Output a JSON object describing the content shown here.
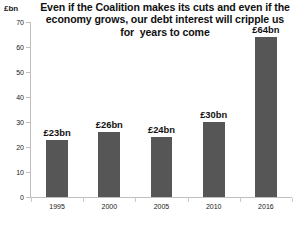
{
  "chart_data": {
    "type": "bar",
    "title": "Even if the Coalition makes its cuts and even if the\neconomy grows, our debt interest will cripple us\nfor  years to come",
    "title_lines": [
      "Even if the Coalition makes its cuts and even if the",
      "economy grows, our debt interest will cripple us",
      "for  years to come"
    ],
    "xlabel": "",
    "ylabel": "£bn",
    "ylim": [
      0,
      70
    ],
    "ytick_values": [
      0,
      10,
      20,
      30,
      40,
      50,
      60,
      70
    ],
    "ytick_labels": [
      "0",
      "10",
      "20",
      "30",
      "40",
      "50",
      "60",
      "70"
    ],
    "categories": [
      "1995",
      "2000",
      "2005",
      "2010",
      "2016"
    ],
    "values": [
      23,
      26,
      24,
      30,
      64
    ],
    "data_labels": [
      "£23bn",
      "£26bn",
      "£24bn",
      "£30bn",
      "£64bn"
    ],
    "grid": false,
    "legend": null,
    "bar_color": "#565656",
    "axis_color": "#bfbfbf",
    "background": "#ffffff"
  }
}
